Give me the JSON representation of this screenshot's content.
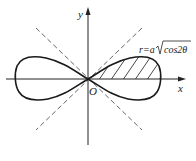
{
  "figure": {
    "type": "polar curve diagram",
    "curve_name": "lemniscate",
    "equation_label": "r=a√cos2θ",
    "equation_parts": {
      "lhs": "r=a",
      "radicand": "cos2θ"
    },
    "axis_labels": {
      "x": "x",
      "y": "y",
      "origin": "O"
    },
    "asymptote_lines": [
      "θ=π/4",
      "θ=-π/4"
    ],
    "hatched_region": "first-quadrant half of right lobe",
    "colors": {
      "curve": "#1a1a1a",
      "axes": "#222222",
      "dashed": "#555555",
      "hatch": "#333333",
      "background": "#ffffff"
    }
  }
}
